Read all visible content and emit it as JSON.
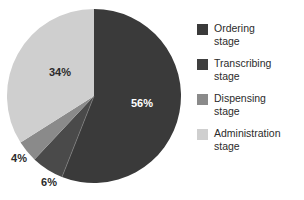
{
  "chart_data": {
    "type": "pie",
    "title": "",
    "subtitle": "",
    "xlabel": "",
    "ylabel": "",
    "grid": false,
    "legend_position": "right",
    "unit": "%",
    "categories": [
      "Ordering stage",
      "Transcribing stage",
      "Dispensing stage",
      "Administration stage"
    ],
    "values": [
      56,
      6,
      4,
      34
    ],
    "data_labels": [
      "56%",
      "6%",
      "4%",
      "34%"
    ],
    "colors": [
      "#3a3a3a",
      "#4a4a4a",
      "#8a8a8a",
      "#cfcfcf"
    ],
    "label_placement": [
      "inside",
      "outside",
      "outside",
      "inside"
    ],
    "start_angle_deg": 0,
    "direction": "clockwise",
    "series": [
      {
        "name": "Medication error stage",
        "values": [
          56,
          6,
          4,
          34
        ]
      }
    ],
    "slices": [
      {
        "label": "Ordering stage",
        "value": 56,
        "data_label": "56%",
        "color": "#3a3a3a",
        "label_x": 142,
        "label_y": 107,
        "label_placement": "inside-dark"
      },
      {
        "label": "Transcribing stage",
        "value": 6,
        "data_label": "6%",
        "color": "#4a4a4a",
        "label_x": 49,
        "label_y": 186,
        "label_placement": "outside"
      },
      {
        "label": "Dispensing stage",
        "value": 4,
        "data_label": "4%",
        "color": "#8a8a8a",
        "label_x": 19,
        "label_y": 162,
        "label_placement": "outside"
      },
      {
        "label": "Administration stage",
        "value": 34,
        "data_label": "34%",
        "color": "#cfcfcf",
        "label_x": 60,
        "label_y": 76,
        "label_placement": "inside-light"
      }
    ],
    "geometry": {
      "center_x": 94,
      "center_y": 96,
      "radius": 87
    }
  },
  "legend": {
    "items": [
      {
        "label": "Ordering\nstage",
        "color": "#3a3a3a",
        "swatch_name": "legend-swatch-ordering"
      },
      {
        "label": "Transcribing\nstage",
        "color": "#3f3f3f",
        "swatch_name": "legend-swatch-transcribing"
      },
      {
        "label": "Dispensing\nstage",
        "color": "#8a8a8a",
        "swatch_name": "legend-swatch-dispensing"
      },
      {
        "label": "Administration\nstage",
        "color": "#cfcfcf",
        "swatch_name": "legend-swatch-administration"
      }
    ]
  },
  "figure": {
    "background": "#ffffff"
  }
}
